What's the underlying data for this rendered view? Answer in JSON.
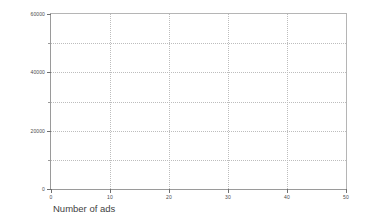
{
  "chart_data": {
    "type": "scatter",
    "title": "",
    "subtitle": "",
    "xlabel": "Number of ads",
    "ylabel": "Sales revenues",
    "xlim": [
      0,
      50
    ],
    "ylim": [
      0,
      60000
    ],
    "x_ticks": [
      0,
      10,
      20,
      30,
      40,
      50
    ],
    "x_tick_labels": [
      "0",
      "10",
      "20",
      "30",
      "40",
      "50"
    ],
    "y_ticks": [
      0,
      20000,
      40000,
      60000
    ],
    "y_tick_labels": [
      "0",
      "20000",
      "40000",
      "60000"
    ],
    "y_minor_ticks": [
      10000,
      30000,
      50000
    ],
    "x_gridlines": [
      10,
      20,
      30,
      40
    ],
    "y_gridlines": [
      10000,
      20000,
      30000,
      40000,
      50000
    ],
    "grid": true,
    "grid_style": "dotted",
    "legend": false,
    "legend_position": "none",
    "series": [
      {
        "name": "",
        "x": [],
        "y": []
      }
    ],
    "annotations": [],
    "colors": {
      "background": "#ffffff",
      "plot_background": "#ffffff",
      "axis_line": "#9a9a9a",
      "grid_line": "#bdbdbd",
      "tick_label": "#4a4a4a",
      "axis_title": "#3f3f3f"
    }
  },
  "axes": {
    "y": {
      "title": "Sales revenues",
      "labels": [
        {
          "value": 60000,
          "text": "60000"
        },
        {
          "value": 40000,
          "text": "40000"
        },
        {
          "value": 20000,
          "text": "20000"
        },
        {
          "value": 0,
          "text": "0"
        }
      ]
    },
    "x": {
      "title": "Number of ads",
      "labels": [
        {
          "value": 0,
          "text": "0"
        },
        {
          "value": 10,
          "text": "10"
        },
        {
          "value": 20,
          "text": "20"
        },
        {
          "value": 30,
          "text": "30"
        },
        {
          "value": 40,
          "text": "40"
        },
        {
          "value": 50,
          "text": "50"
        }
      ]
    }
  }
}
